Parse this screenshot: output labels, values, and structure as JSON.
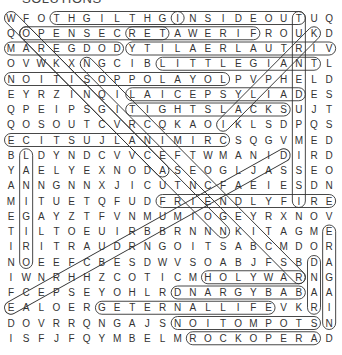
{
  "header": "SOLUTIONS",
  "grid": [
    "WFOTHGILTHGINSIDEOUTUQ",
    "QOPENSECRETAWERIFROUKD",
    "MAREGDODYTILAERLAUTRIV",
    "OVWKXNGCIBLITTLEGIANTL",
    "NOITISOPPOLAYOLPVPHELD",
    "EYRZINQILAICEPSYLIADES",
    "QPEIPSGITIGHTSLACKSUJT",
    "QOSOUTCVRCQKAOIKLSDPQS",
    "ECITSUJLANIMIRCSQGVMED",
    "BLDYNDCVVCEFTWMANIDIRD",
    "YAELYEXNODASEOGLJASSEO",
    "ANNGNNXJICUTNCFAEIESDN",
    "MITUETQFUDFRIENDLYFIRE",
    "EGAYZTFVNMUMIOGEYRXNOV",
    "TILTOEUIRBBRNNNKITAGME",
    "IRITRAUDRNGOITSABCMDOR",
    "NOEEFCBESDWVSOABJFSBDA",
    "IWNRHHZCOTICMHOLYWARNG",
    "FCEPSEYOHLRDNARGYBABAA",
    "EALOERGETERNALLIFEVKRI",
    "DOVRRQNGAJSNOITOMPOTSN",
    "ISFJFQYMBELMROCKOPERAD"
  ],
  "found_words": [
    {
      "word": "NIGHTLIGHT",
      "r1": 0,
      "c1": 3,
      "r2": 0,
      "c2": 11
    },
    {
      "word": "INSIDEOUT",
      "r1": 0,
      "c1": 11,
      "r2": 0,
      "c2": 19
    },
    {
      "word": "OPENSECRET",
      "r1": 1,
      "c1": 1,
      "r2": 1,
      "c2": 10
    },
    {
      "word": "FIREWATER",
      "r1": 1,
      "c1": 8,
      "r2": 1,
      "c2": 16
    },
    {
      "word": "DOGDERAM",
      "r1": 2,
      "c1": 0,
      "r2": 2,
      "c2": 7
    },
    {
      "word": "VIRTUALREALITY",
      "r1": 2,
      "c1": 8,
      "r2": 2,
      "c2": 21
    },
    {
      "word": "LITTLEGIANT",
      "r1": 3,
      "c1": 10,
      "r2": 3,
      "c2": 20
    },
    {
      "word": "LOYALOPPOSITION",
      "r1": 4,
      "c1": 0,
      "r2": 4,
      "c2": 14
    },
    {
      "word": "DAILYSPECIAL",
      "r1": 5,
      "c1": 8,
      "r2": 5,
      "c2": 19
    },
    {
      "word": "TIGHTSLACKS",
      "r1": 6,
      "c1": 8,
      "r2": 6,
      "c2": 18
    },
    {
      "word": "CRIMINALJUSTICE",
      "r1": 8,
      "c1": 0,
      "r2": 8,
      "c2": 14
    },
    {
      "word": "FRIENDLYFIRE",
      "r1": 12,
      "c1": 10,
      "r2": 12,
      "c2": 21
    },
    {
      "word": "HOLYWAR",
      "r1": 17,
      "c1": 13,
      "r2": 17,
      "c2": 19
    },
    {
      "word": "BABYGRAND",
      "r1": 18,
      "c1": 11,
      "r2": 18,
      "c2": 19
    },
    {
      "word": "GETERNALLIFE",
      "r1": 19,
      "c1": 6,
      "r2": 19,
      "c2": 17
    },
    {
      "word": "STOPMOTION",
      "r1": 20,
      "c1": 11,
      "r2": 20,
      "c2": 20
    },
    {
      "word": "ROCKOPERA",
      "r1": 21,
      "c1": 12,
      "r2": 21,
      "c2": 20
    },
    {
      "word": "diag1",
      "r1": 0,
      "c1": 0,
      "r2": 10,
      "c2": 10
    },
    {
      "word": "diag2",
      "r1": 1,
      "c1": 1,
      "r2": 14,
      "c2": 14
    },
    {
      "word": "diag3",
      "r1": 3,
      "c1": 5,
      "r2": 17,
      "c2": 19
    },
    {
      "word": "diag4",
      "r1": 1,
      "c1": 20,
      "r2": 7,
      "c2": 14
    },
    {
      "word": "diag5",
      "r1": 9,
      "c1": 18,
      "r2": 19,
      "c2": 0
    },
    {
      "word": "col1",
      "r1": 9,
      "c1": 1,
      "r2": 16,
      "c2": 1
    },
    {
      "word": "col2",
      "r1": 14,
      "c1": 21,
      "r2": 20,
      "c2": 21
    },
    {
      "word": "col3",
      "r1": 0,
      "c1": 19,
      "r2": 12,
      "c2": 19
    },
    {
      "word": "col4",
      "r1": 16,
      "c1": 20,
      "r2": 19,
      "c2": 20
    }
  ]
}
